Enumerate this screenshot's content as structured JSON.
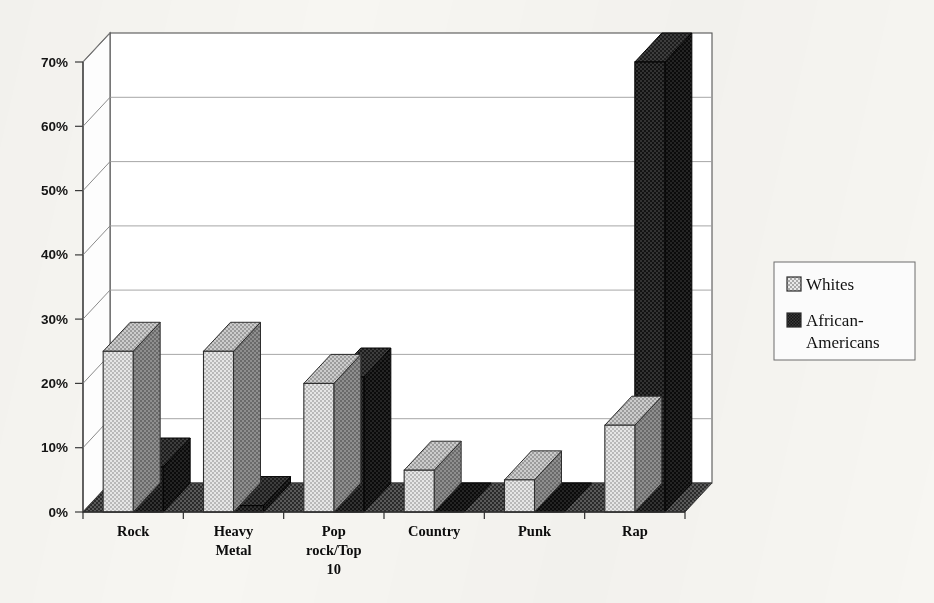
{
  "chart_data": {
    "type": "bar",
    "title": "",
    "subtitle": "",
    "xlabel": "",
    "ylabel": "",
    "categories": [
      "Rock",
      "Heavy\nMetal",
      "Pop\nrock/Top\n10",
      "Country",
      "Punk",
      "Rap"
    ],
    "category_labels": [
      [
        "Rock"
      ],
      [
        "Heavy",
        "Metal"
      ],
      [
        "Pop",
        "rock/Top",
        "10"
      ],
      [
        "Country"
      ],
      [
        "Punk"
      ],
      [
        "Rap"
      ]
    ],
    "series": [
      {
        "name": "Whites",
        "values": [
          25,
          25,
          20,
          6.5,
          5,
          13.5
        ],
        "color": "#d2d2d2",
        "pattern": "light-checker"
      },
      {
        "name": "African-Americans",
        "values": [
          7,
          1,
          21,
          0,
          0,
          70
        ],
        "color": "#1d1d1d",
        "pattern": "dark-checker"
      }
    ],
    "ylim": [
      0,
      70
    ],
    "yticks": [
      0,
      10,
      20,
      30,
      40,
      50,
      60,
      70
    ],
    "ytick_labels": [
      "0%",
      "10%",
      "20%",
      "30%",
      "40%",
      "50%",
      "60%",
      "70%"
    ],
    "grid": true,
    "grid_axis": "y",
    "legend_position": "right",
    "style": "3d-column",
    "plot_background": "#ffffff"
  },
  "legend": {
    "entries": [
      {
        "label": "Whites",
        "swatch": "light-checker-swatch"
      },
      {
        "label": "African-Americans",
        "swatch": "dark-checker-swatch"
      }
    ]
  },
  "colors": {
    "page_background": "#f7f6f2",
    "plot_background": "#ffffff",
    "axis_line": "#3a3a3a",
    "gridline": "#9a9a9a",
    "series_whites": "#d2d2d2",
    "series_african_americans": "#1d1d1d",
    "text": "#141414"
  }
}
